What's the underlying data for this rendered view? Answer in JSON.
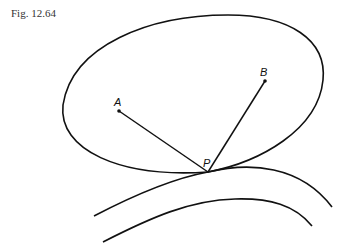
{
  "figure": {
    "caption": "Fig. 12.64",
    "points": {
      "A": {
        "label": "A",
        "x": 119,
        "y": 111
      },
      "B": {
        "label": "B",
        "x": 265,
        "y": 81
      },
      "P": {
        "label": "P",
        "x": 208,
        "y": 172
      }
    },
    "stroke_color": "#111111"
  }
}
